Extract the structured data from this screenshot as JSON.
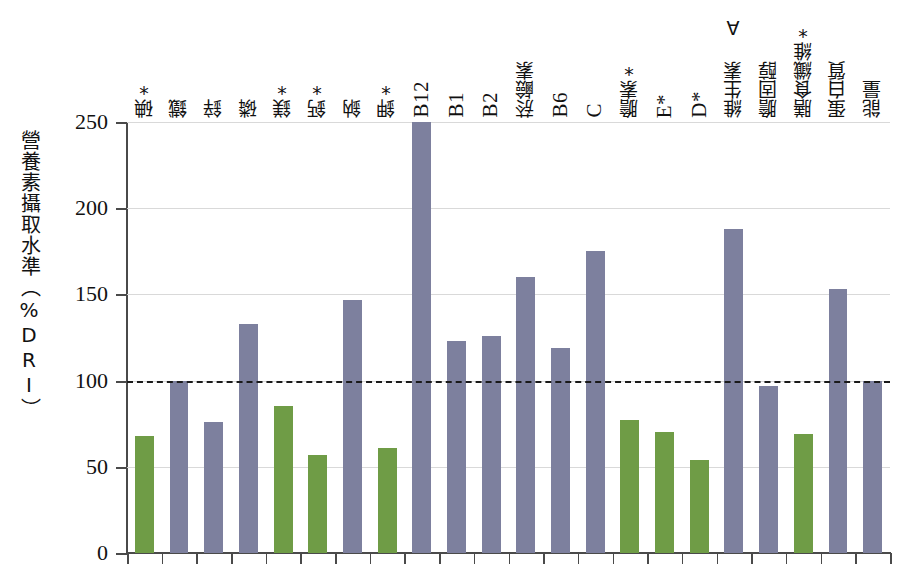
{
  "chart_data": {
    "type": "bar",
    "title": "",
    "xlabel": "",
    "ylabel": "營養素攝取水準（%DRI）",
    "ylim": [
      0,
      250
    ],
    "yticks": [
      0,
      50,
      100,
      150,
      200,
      250
    ],
    "grid": true,
    "legend": "none",
    "reference_line": {
      "value": 100,
      "style": "dashed",
      "color": "#1a1a1a"
    },
    "colors": {
      "below_dri": "#6f9c46",
      "at_or_above_dri": "#7d809e",
      "axis": "#4a4a4a",
      "gridline": "#d9d9d9"
    },
    "categories": [
      "碘*",
      "鐵",
      "鋅",
      "磷",
      "鎂*",
      "鈣*",
      "鈉",
      "鉀*",
      "B12",
      "B1",
      "B2",
      "菸鹼素",
      "B6",
      "C",
      "膽素*",
      "E*",
      "D*",
      "維生素 A",
      "膽固醇",
      "膳食纖維*",
      "蛋白質",
      "能量"
    ],
    "values": [
      68,
      100,
      76,
      133,
      85,
      57,
      147,
      61,
      251,
      123,
      126,
      160,
      119,
      175,
      77,
      70,
      54,
      188,
      97,
      69,
      153,
      100
    ],
    "bar_colors": [
      "green",
      "purple",
      "purple",
      "purple",
      "green",
      "green",
      "purple",
      "green",
      "purple",
      "purple",
      "purple",
      "purple",
      "purple",
      "purple",
      "green",
      "green",
      "green",
      "purple",
      "purple",
      "green",
      "purple",
      "purple"
    ],
    "label_scripts": [
      "cjk",
      "cjk",
      "cjk",
      "cjk",
      "cjk",
      "cjk",
      "cjk",
      "cjk",
      "latin",
      "latin",
      "latin",
      "cjk",
      "latin",
      "latin",
      "cjk",
      "latin",
      "latin",
      "cjk",
      "cjk",
      "cjk",
      "cjk",
      "cjk"
    ]
  }
}
